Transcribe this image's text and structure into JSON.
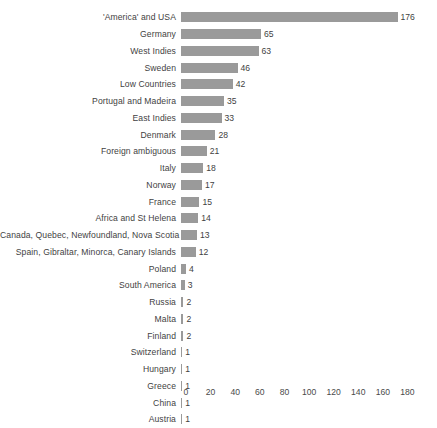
{
  "chart_data": {
    "type": "bar",
    "orientation": "horizontal",
    "title": "",
    "subtitle": "",
    "xlabel": "",
    "ylabel": "",
    "xlim": [
      0,
      180
    ],
    "xticks": [
      0,
      20,
      40,
      60,
      80,
      100,
      120,
      140,
      160,
      180
    ],
    "grid": false,
    "legend": false,
    "data_labels": true,
    "bar_color": "#9a9a9a",
    "text_color": "#3f3f3f",
    "background": "#ffffff",
    "categories": [
      "'America' and USA",
      "Germany",
      "West Indies",
      "Sweden",
      "Low Countries",
      "Portugal and Madeira",
      "East Indies",
      "Denmark",
      "Foreign ambiguous",
      "Italy",
      "Norway",
      "France",
      "Africa and St Helena",
      "Canada, Quebec, Newfoundland, Nova Scotia",
      "Spain, Gibraltar, Minorca, Canary Islands",
      "Poland",
      "South America",
      "Russia",
      "Malta",
      "Finland",
      "Switzerland",
      "Hungary",
      "Greece",
      "China",
      "Austria"
    ],
    "values": [
      176,
      65,
      63,
      46,
      42,
      35,
      33,
      28,
      21,
      18,
      17,
      15,
      14,
      13,
      12,
      4,
      3,
      2,
      2,
      2,
      1,
      1,
      1,
      1,
      1
    ],
    "value_labels": [
      "176",
      "65",
      "63",
      "46",
      "42",
      "35",
      "33",
      "28",
      "21",
      "18",
      "17",
      "15",
      "14",
      "13",
      "12",
      "4",
      "3",
      "2",
      "2",
      "2",
      "1",
      "1",
      "1",
      "1",
      "1"
    ],
    "xtick_labels": [
      "0",
      "20",
      "40",
      "60",
      "80",
      "100",
      "120",
      "140",
      "160",
      "180"
    ]
  }
}
